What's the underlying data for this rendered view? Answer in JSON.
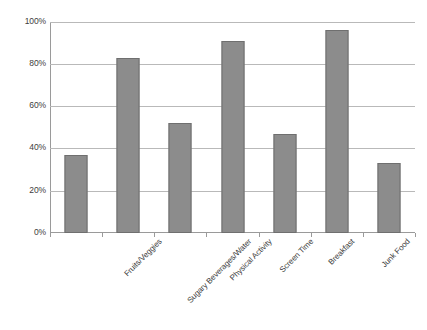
{
  "chart_data": {
    "type": "bar",
    "title": "",
    "subtitle": "",
    "xlabel": "",
    "ylabel": "",
    "categories": [
      "Fruits/Veggies",
      "Sugary Beverages/Water",
      "Physical Activity",
      "Screen Time",
      "Breakfast",
      "Junk Food",
      "Mental Resilience"
    ],
    "values": [
      37,
      83,
      52,
      91,
      47,
      96,
      33
    ],
    "value_suffix": "%",
    "ylim": [
      0,
      100
    ],
    "y_ticks": [
      0,
      20,
      40,
      60,
      80,
      100
    ],
    "y_tick_labels": [
      "0%",
      "20%",
      "40%",
      "60%",
      "80%",
      "100%"
    ],
    "grid": true,
    "grid_axis": "y",
    "legend": false,
    "legend_position": "none",
    "series": [
      {
        "name": "",
        "values": [
          37,
          83,
          52,
          91,
          47,
          96,
          33
        ]
      }
    ]
  },
  "style": {
    "background": "#ffffff",
    "bar_fill": "#8c8c8c",
    "bar_border": "#6f6f6f",
    "gridline_color": "#b9b9b9",
    "axis_color": "#9a9a9a",
    "text_color": "#3b3b3b"
  }
}
